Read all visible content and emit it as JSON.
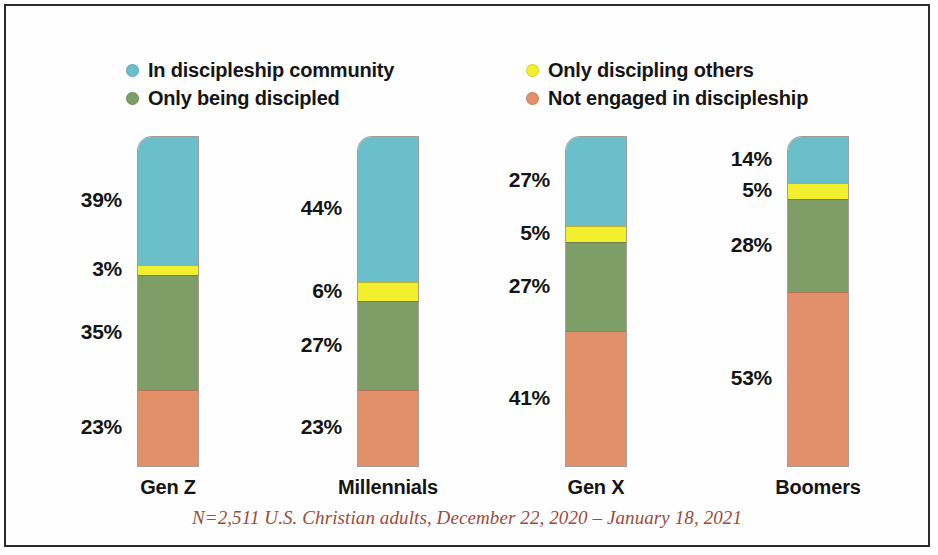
{
  "chart_data": {
    "type": "bar",
    "subtype": "stacked-column-100",
    "title": "",
    "subtitle": "",
    "xlabel": "",
    "ylabel": "",
    "ylim": [
      0,
      100
    ],
    "grid": false,
    "legend_position": "top",
    "categories": [
      "Gen Z",
      "Millennials",
      "Gen X",
      "Boomers"
    ],
    "series": [
      {
        "name": "In discipleship community",
        "color": "#6BBFCB",
        "values": [
          39,
          44,
          27,
          14
        ]
      },
      {
        "name": "Only discipling others",
        "color": "#F2EF2E",
        "values": [
          3,
          6,
          5,
          5
        ]
      },
      {
        "name": "Only being discipled",
        "color": "#7D9E66",
        "values": [
          35,
          27,
          27,
          28
        ]
      },
      {
        "name": "Not engaged in discipleship",
        "color": "#E2906A",
        "values": [
          23,
          23,
          41,
          53
        ]
      }
    ],
    "annotations": [
      "N=2,511 U.S. Christian adults, December 22, 2020 – January 18, 2021"
    ]
  },
  "legend": {
    "items": [
      {
        "label": "In discipleship community",
        "color": "#6BBFCB"
      },
      {
        "label": "Only being discipled",
        "color": "#7D9E66"
      },
      {
        "label": "Only discipling others",
        "color": "#F2EF2E"
      },
      {
        "label": "Not engaged in discipleship",
        "color": "#E2906A"
      }
    ]
  },
  "bars": [
    {
      "category": "Gen Z",
      "left": 132,
      "segments": [
        {
          "series": "In discipleship community",
          "label": "39%",
          "value": 39,
          "color": "#6BBFCB"
        },
        {
          "series": "Only discipling others",
          "label": "3%",
          "value": 3,
          "color": "#F2EF2E"
        },
        {
          "series": "Only being discipled",
          "label": "35%",
          "value": 35,
          "color": "#7D9E66"
        },
        {
          "series": "Not engaged in discipleship",
          "label": "23%",
          "value": 23,
          "color": "#E2906A"
        }
      ]
    },
    {
      "category": "Millennials",
      "left": 352,
      "segments": [
        {
          "series": "In discipleship community",
          "label": "44%",
          "value": 44,
          "color": "#6BBFCB"
        },
        {
          "series": "Only discipling others",
          "label": "6%",
          "value": 6,
          "color": "#F2EF2E"
        },
        {
          "series": "Only being discipled",
          "label": "27%",
          "value": 27,
          "color": "#7D9E66"
        },
        {
          "series": "Not engaged in discipleship",
          "label": "23%",
          "value": 23,
          "color": "#E2906A"
        }
      ]
    },
    {
      "category": "Gen X",
      "left": 560,
      "segments": [
        {
          "series": "In discipleship community",
          "label": "27%",
          "value": 27,
          "color": "#6BBFCB"
        },
        {
          "series": "Only discipling others",
          "label": "5%",
          "value": 5,
          "color": "#F2EF2E"
        },
        {
          "series": "Only being discipled",
          "label": "27%",
          "value": 27,
          "color": "#7D9E66"
        },
        {
          "series": "Not engaged in discipleship",
          "label": "41%",
          "value": 41,
          "color": "#E2906A"
        }
      ]
    },
    {
      "category": "Boomers",
      "left": 782,
      "segments": [
        {
          "series": "In discipleship community",
          "label": "14%",
          "value": 14,
          "color": "#6BBFCB"
        },
        {
          "series": "Only discipling others",
          "label": "5%",
          "value": 5,
          "color": "#F2EF2E"
        },
        {
          "series": "Only being discipled",
          "label": "28%",
          "value": 28,
          "color": "#7D9E66"
        },
        {
          "series": "Not engaged in discipleship",
          "label": "53%",
          "value": 53,
          "color": "#E2906A"
        }
      ]
    }
  ],
  "footnote": "N=2,511 U.S. Christian adults, December 22, 2020 – January 18, 2021",
  "colors": {
    "teal": "#6BBFCB",
    "yellow": "#F2EF2E",
    "green": "#7D9E66",
    "salmon": "#E2906A",
    "footnote_text": "#9b4a3c",
    "frame": "#2b2b2b"
  }
}
